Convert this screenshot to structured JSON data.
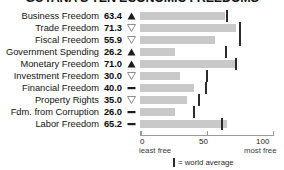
{
  "chart_data": {
    "type": "bar",
    "title": "GUYANA'S TEN ECONOMIC FREEDOMS",
    "xlabel": "",
    "ylabel": "",
    "xlim": [
      0,
      100
    ],
    "grid": false,
    "legend_position": "bottom-center",
    "categories": [
      "Business Freedom",
      "Trade Freedom",
      "Fiscal Freedom",
      "Government Spending",
      "Monetary Freedom",
      "Investment Freedom",
      "Financial Freedom",
      "Property Rights",
      "Fdm. from Corruption",
      "Labor Freedom"
    ],
    "values": [
      63.4,
      71.3,
      55.9,
      26.2,
      71.0,
      30.0,
      40.0,
      35.0,
      26.0,
      65.2
    ],
    "value_labels": [
      "63.4",
      "71.3",
      "55.9",
      "26.2",
      "71.0",
      "30.0",
      "40.0",
      "35.0",
      "26.0",
      "65.2"
    ],
    "trends": [
      "up",
      "down",
      "down",
      "up",
      "up",
      "down",
      "flat",
      "down",
      "flat",
      "flat"
    ],
    "world_average": [
      65.0,
      74.5,
      74.8,
      64.5,
      71.8,
      50.0,
      49.0,
      44.0,
      40.5,
      61.5
    ],
    "bar_color": "#c9c9c9",
    "marker_color": "#2b2b2b",
    "axis_ticks": [
      "0",
      "50",
      "100"
    ],
    "axis_tick_values": [
      0,
      50,
      100
    ],
    "axis_note_left": "least free",
    "axis_note_right": "most free",
    "legend_label": "= world average"
  }
}
